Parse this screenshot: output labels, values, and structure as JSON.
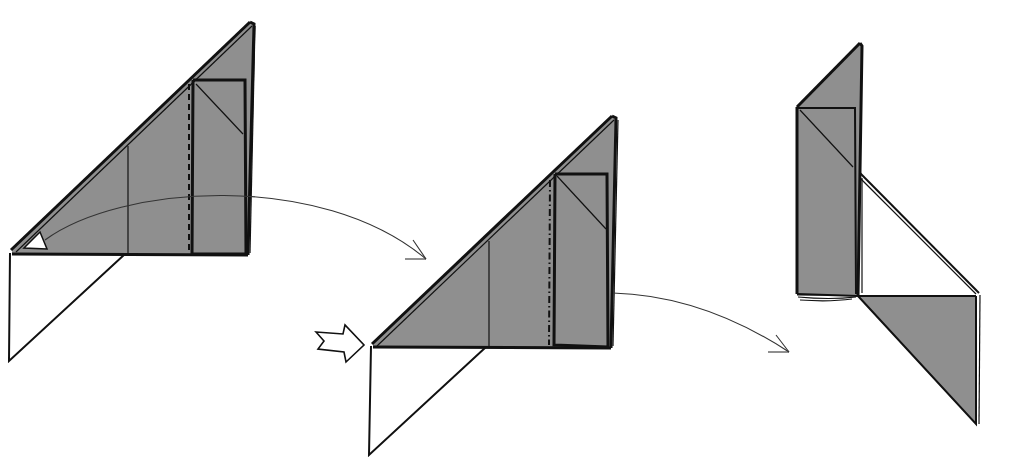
{
  "diagram": {
    "colors": {
      "paper_colored": "#8f8f8f",
      "paper_white": "#ffffff",
      "line": "#111111",
      "background": "#ffffff"
    },
    "steps": [
      {
        "id": "step-1",
        "description": "Triangular flap with inner rectangle; valley fold (dashed line) near the right; white reference triangle at left corner",
        "symbols": [
          "valley-fold-line",
          "reference-triangle",
          "motion-arrow"
        ]
      },
      {
        "id": "step-2",
        "description": "Same shape with mountain/dash-dot line; push arrow pointing at the left corner",
        "symbols": [
          "mountain-fold-line",
          "push-arrow",
          "motion-arrow"
        ]
      },
      {
        "id": "step-3",
        "description": "Result: tall colored column with triangular flap swung down at the lower right",
        "symbols": []
      }
    ],
    "arrows": [
      {
        "id": "arrow-1-to-2",
        "type": "motion",
        "from": "step-1",
        "to": "step-2"
      },
      {
        "id": "arrow-2-to-3",
        "type": "motion",
        "from": "step-2",
        "to": "step-3"
      },
      {
        "id": "push-arrow",
        "type": "push",
        "target": "step-2"
      }
    ]
  }
}
